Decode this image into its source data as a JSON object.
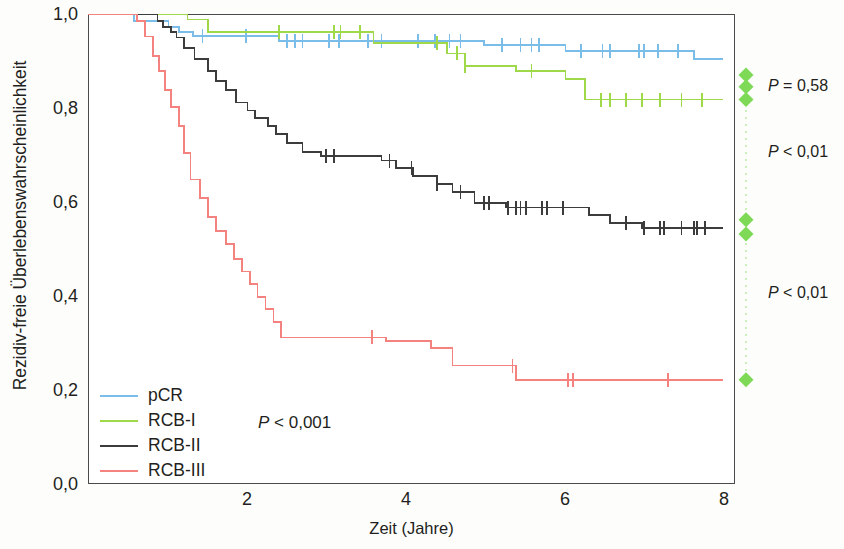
{
  "chart_data": {
    "type": "line",
    "subtype": "kaplan-meier-step",
    "title": "",
    "xlabel": "Zeit (Jahre)",
    "ylabel": "Rezidiv-freie Überlebenswahrscheinlichkeit",
    "xlim": [
      0,
      8.2
    ],
    "ylim": [
      0.0,
      1.0
    ],
    "xticks": [
      2,
      4,
      6,
      8
    ],
    "xtick_labels": [
      "2",
      "4",
      "6",
      "8"
    ],
    "yticks": [
      0.0,
      0.2,
      0.4,
      0.6,
      0.8,
      1.0
    ],
    "ytick_labels": [
      "0,0",
      "0,2",
      "0,4",
      "0,6",
      "0,8",
      "1,0"
    ],
    "grid": false,
    "legend_position": "bottom-left",
    "overall_p_label": "P < 0,001",
    "series": [
      {
        "name": "pCR",
        "color": "#79bde8",
        "points": [
          [
            0.0,
            1.0
          ],
          [
            0.58,
            1.0
          ],
          [
            0.58,
            0.985
          ],
          [
            1.02,
            0.985
          ],
          [
            1.02,
            0.972
          ],
          [
            1.15,
            0.972
          ],
          [
            1.15,
            0.962
          ],
          [
            1.33,
            0.962
          ],
          [
            1.33,
            0.953
          ],
          [
            2.42,
            0.953
          ],
          [
            2.42,
            0.943
          ],
          [
            5.02,
            0.943
          ],
          [
            5.02,
            0.934
          ],
          [
            6.05,
            0.934
          ],
          [
            6.05,
            0.921
          ],
          [
            7.68,
            0.921
          ],
          [
            7.68,
            0.905
          ],
          [
            8.05,
            0.905
          ]
        ],
        "censor_times": [
          1.45,
          2.0,
          2.52,
          2.62,
          2.72,
          3.05,
          3.18,
          3.55,
          3.72,
          4.18,
          4.4,
          4.58,
          4.72,
          5.25,
          5.48,
          5.62,
          5.72,
          6.25,
          6.52,
          6.62,
          6.98,
          7.05,
          7.22,
          7.48
        ]
      },
      {
        "name": "RCB-I",
        "color": "#9fd94a",
        "points": [
          [
            0.0,
            1.0
          ],
          [
            1.26,
            1.0
          ],
          [
            1.26,
            0.988
          ],
          [
            1.52,
            0.988
          ],
          [
            1.52,
            0.962
          ],
          [
            3.62,
            0.962
          ],
          [
            3.62,
            0.938
          ],
          [
            4.55,
            0.938
          ],
          [
            4.55,
            0.916
          ],
          [
            4.78,
            0.916
          ],
          [
            4.78,
            0.89
          ],
          [
            5.42,
            0.89
          ],
          [
            5.42,
            0.878
          ],
          [
            6.05,
            0.878
          ],
          [
            6.05,
            0.862
          ],
          [
            6.3,
            0.862
          ],
          [
            6.3,
            0.818
          ],
          [
            8.05,
            0.818
          ]
        ],
        "censor_times": [
          2.42,
          3.12,
          3.2,
          3.45,
          4.42,
          4.68,
          4.78,
          5.62,
          6.5,
          6.62,
          6.82,
          7.02,
          7.25,
          7.52,
          7.78
        ]
      },
      {
        "name": "RCB-II",
        "color": "#3c3c3c",
        "points": [
          [
            0.0,
            1.0
          ],
          [
            0.88,
            1.0
          ],
          [
            0.88,
            0.985
          ],
          [
            0.95,
            0.985
          ],
          [
            0.95,
            0.972
          ],
          [
            1.05,
            0.972
          ],
          [
            1.05,
            0.962
          ],
          [
            1.12,
            0.962
          ],
          [
            1.12,
            0.95
          ],
          [
            1.22,
            0.95
          ],
          [
            1.22,
            0.928
          ],
          [
            1.35,
            0.928
          ],
          [
            1.35,
            0.905
          ],
          [
            1.52,
            0.905
          ],
          [
            1.52,
            0.878
          ],
          [
            1.62,
            0.878
          ],
          [
            1.62,
            0.858
          ],
          [
            1.75,
            0.858
          ],
          [
            1.75,
            0.838
          ],
          [
            1.88,
            0.838
          ],
          [
            1.88,
            0.812
          ],
          [
            2.02,
            0.812
          ],
          [
            2.02,
            0.795
          ],
          [
            2.12,
            0.795
          ],
          [
            2.12,
            0.778
          ],
          [
            2.28,
            0.778
          ],
          [
            2.28,
            0.762
          ],
          [
            2.38,
            0.762
          ],
          [
            2.38,
            0.745
          ],
          [
            2.52,
            0.745
          ],
          [
            2.52,
            0.725
          ],
          [
            2.72,
            0.725
          ],
          [
            2.72,
            0.706
          ],
          [
            2.95,
            0.706
          ],
          [
            2.95,
            0.698
          ],
          [
            3.72,
            0.698
          ],
          [
            3.72,
            0.688
          ],
          [
            3.9,
            0.688
          ],
          [
            3.9,
            0.672
          ],
          [
            4.12,
            0.672
          ],
          [
            4.12,
            0.655
          ],
          [
            4.42,
            0.655
          ],
          [
            4.42,
            0.638
          ],
          [
            4.62,
            0.638
          ],
          [
            4.62,
            0.622
          ],
          [
            4.9,
            0.622
          ],
          [
            4.9,
            0.598
          ],
          [
            5.3,
            0.598
          ],
          [
            5.3,
            0.588
          ],
          [
            6.35,
            0.588
          ],
          [
            6.35,
            0.572
          ],
          [
            6.62,
            0.572
          ],
          [
            6.62,
            0.555
          ],
          [
            7.02,
            0.555
          ],
          [
            7.02,
            0.545
          ],
          [
            8.05,
            0.545
          ]
        ],
        "censor_times": [
          3.02,
          3.12,
          3.82,
          4.1,
          4.42,
          4.72,
          5.02,
          5.08,
          5.32,
          5.42,
          5.48,
          5.55,
          5.75,
          5.82,
          6.02,
          6.82,
          7.05,
          7.25,
          7.3,
          7.52,
          7.68,
          7.72,
          7.82
        ]
      },
      {
        "name": "RCB-III",
        "color": "#f4827e",
        "points": [
          [
            0.0,
            1.0
          ],
          [
            0.62,
            1.0
          ],
          [
            0.62,
            0.985
          ],
          [
            0.72,
            0.985
          ],
          [
            0.72,
            0.952
          ],
          [
            0.82,
            0.952
          ],
          [
            0.82,
            0.91
          ],
          [
            0.9,
            0.91
          ],
          [
            0.9,
            0.878
          ],
          [
            0.98,
            0.878
          ],
          [
            0.98,
            0.838
          ],
          [
            1.05,
            0.838
          ],
          [
            1.05,
            0.802
          ],
          [
            1.15,
            0.802
          ],
          [
            1.15,
            0.762
          ],
          [
            1.22,
            0.762
          ],
          [
            1.22,
            0.705
          ],
          [
            1.3,
            0.705
          ],
          [
            1.3,
            0.648
          ],
          [
            1.42,
            0.648
          ],
          [
            1.42,
            0.608
          ],
          [
            1.52,
            0.608
          ],
          [
            1.52,
            0.568
          ],
          [
            1.62,
            0.568
          ],
          [
            1.62,
            0.538
          ],
          [
            1.75,
            0.538
          ],
          [
            1.75,
            0.51
          ],
          [
            1.85,
            0.51
          ],
          [
            1.85,
            0.478
          ],
          [
            1.95,
            0.478
          ],
          [
            1.95,
            0.452
          ],
          [
            2.05,
            0.452
          ],
          [
            2.05,
            0.425
          ],
          [
            2.15,
            0.425
          ],
          [
            2.15,
            0.398
          ],
          [
            2.25,
            0.398
          ],
          [
            2.25,
            0.372
          ],
          [
            2.35,
            0.372
          ],
          [
            2.35,
            0.345
          ],
          [
            2.45,
            0.345
          ],
          [
            2.45,
            0.312
          ],
          [
            3.78,
            0.312
          ],
          [
            3.78,
            0.305
          ],
          [
            4.35,
            0.305
          ],
          [
            4.35,
            0.29
          ],
          [
            4.62,
            0.29
          ],
          [
            4.62,
            0.252
          ],
          [
            5.42,
            0.252
          ],
          [
            5.42,
            0.222
          ],
          [
            8.05,
            0.222
          ]
        ],
        "censor_times": [
          3.6,
          5.38,
          6.08,
          6.15,
          7.35
        ]
      }
    ],
    "right_annotations": [
      {
        "label": "P = 0,58",
        "comparison": "pCR vs RCB-I",
        "markers_y": [
          0.87,
          0.845,
          0.818
        ],
        "text_y": 0.845
      },
      {
        "label": "P < 0,01",
        "comparison": "RCB-I vs RCB-II",
        "markers_y": [],
        "text_y": 0.705
      },
      {
        "label": "P < 0,01",
        "comparison": "RCB-II vs RCB-III",
        "markers_y": [
          0.562,
          0.532,
          0.222
        ],
        "text_y": 0.405
      }
    ],
    "marker_color": "#7ed957",
    "marker_shape": "diamond"
  },
  "legend": {
    "items": [
      {
        "label": "pCR",
        "color": "#79bde8"
      },
      {
        "label": "RCB-I",
        "color": "#9fd94a"
      },
      {
        "label": "RCB-II",
        "color": "#3c3c3c"
      },
      {
        "label": "RCB-III",
        "color": "#f4827e"
      }
    ]
  },
  "axes": {
    "y_title": "Rezidiv-freie Überlebenswahrscheinlichkeit",
    "x_title": "Zeit (Jahre)",
    "y_labels": [
      "1,0",
      "0,8",
      "0,6",
      "0,4",
      "0,2",
      "0,0"
    ],
    "x_labels": [
      "2",
      "4",
      "6",
      "8"
    ]
  },
  "annotations": {
    "overall_p_prefix": "P",
    "overall_p_value": " < 0,001",
    "right": [
      {
        "prefix": "P",
        "value": " = 0,58"
      },
      {
        "prefix": "P",
        "value": " < 0,01"
      },
      {
        "prefix": "P",
        "value": " < 0,01"
      }
    ]
  }
}
